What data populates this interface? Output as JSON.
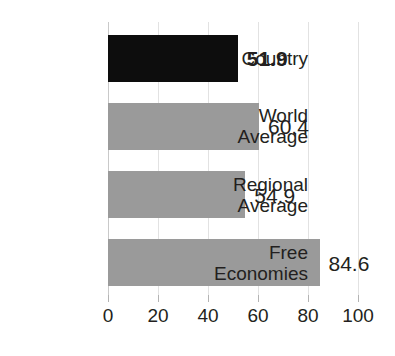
{
  "title": {
    "text": "",
    "cropped": true
  },
  "chart_data": {
    "type": "bar",
    "orientation": "horizontal",
    "title": "",
    "xlabel": "",
    "ylabel": "",
    "xlim": [
      0,
      100
    ],
    "xticks": [
      "0",
      "20",
      "40",
      "60",
      "80",
      "100"
    ],
    "grid": true,
    "legend": false,
    "categories": [
      "Country",
      "World\nAverage",
      "Regional\nAverage",
      "Free\nEconomies"
    ],
    "values": [
      51.9,
      60.4,
      54.9,
      84.6
    ],
    "value_labels": [
      "51.9",
      "60.4",
      "54.9",
      "84.6"
    ],
    "bar_colors": [
      "#0d0d0d",
      "#9a9a9a",
      "#9a9a9a",
      "#9a9a9a"
    ],
    "highlighted_index": 0,
    "colors": {
      "highlight_bar": "#0d0d0d",
      "default_bar": "#9a9a9a",
      "gridline": "#e2e2e2",
      "axis": "#c9c9c9",
      "text": "#231f20",
      "background": "#ffffff"
    }
  }
}
